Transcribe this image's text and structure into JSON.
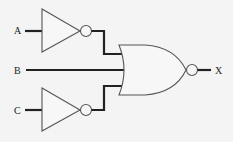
{
  "diagram": {
    "type": "logic-circuit",
    "inputs": [
      {
        "label": "A",
        "gate": "NOT"
      },
      {
        "label": "B",
        "gate": "none"
      },
      {
        "label": "C",
        "gate": "NOT"
      }
    ],
    "gates": [
      {
        "id": "not-a",
        "type": "NOT",
        "input": "A"
      },
      {
        "id": "not-c",
        "type": "NOT",
        "input": "C"
      },
      {
        "id": "nor-1",
        "type": "NOR",
        "inputs": [
          "NOT A",
          "B",
          "NOT C"
        ]
      }
    ],
    "output": {
      "label": "X"
    },
    "colors": {
      "background": "#f4f4f4",
      "line": "#222222",
      "gate_outline": "#555555"
    }
  }
}
